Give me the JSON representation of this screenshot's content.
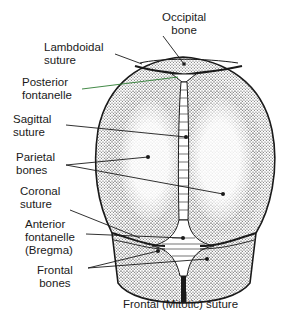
{
  "labels": {
    "occipital_bone": "Occipital\nbone",
    "lambdoidal_suture": "Lambdoidal\nsuture",
    "posterior_fontanelle": "Posterior\nfontanelle",
    "sagittal_suture": "Sagittal\nsuture",
    "parietal_bones": "Parietal\nbones",
    "coronal_suture": "Coronal\nsuture",
    "anterior_fontanelle": "Anterior\nfontanelle\n(Bregma)",
    "frontal_bones": "Frontal\nbones",
    "frontal_suture": "Frontal (Mitotic) suture"
  },
  "colors": {
    "ink": "#1a1a1a",
    "stipple": "#555555",
    "background": "#ffffff",
    "posterior_leader": "#2e7d32"
  }
}
